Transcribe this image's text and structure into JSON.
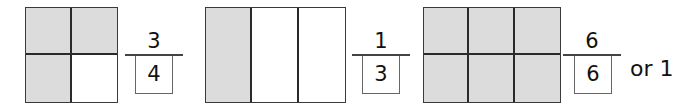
{
  "diagram": {
    "colors": {
      "shaded": "#dcdcdc",
      "unshaded": "#ffffff",
      "lines": "#2a2a2a"
    },
    "models": [
      {
        "rows": 2,
        "cols": 2,
        "shaded_parts": 3,
        "total_parts": 4,
        "cells": [
          "shaded",
          "shaded",
          "shaded",
          "empty"
        ],
        "fraction": {
          "numerator": "3",
          "denominator": "4"
        }
      },
      {
        "rows": 1,
        "cols": 3,
        "shaded_parts": 1,
        "total_parts": 3,
        "cells": [
          "shaded",
          "empty",
          "empty"
        ],
        "fraction": {
          "numerator": "1",
          "denominator": "3"
        }
      },
      {
        "rows": 2,
        "cols": 3,
        "shaded_parts": 6,
        "total_parts": 6,
        "cells": [
          "shaded",
          "shaded",
          "shaded",
          "shaded",
          "shaded",
          "shaded"
        ],
        "fraction": {
          "numerator": "6",
          "denominator": "6"
        },
        "equivalent": "or 1"
      }
    ]
  }
}
